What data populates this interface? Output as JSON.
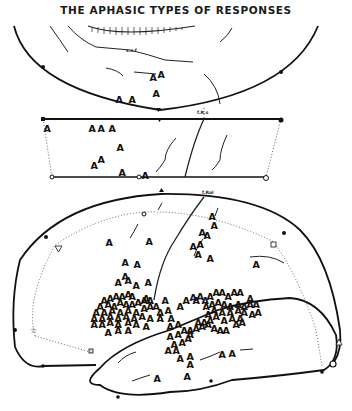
{
  "title": "THE APHASIC TYPES OF RESPONSES",
  "labels": {
    "top_small": "s.c.f",
    "mid_small": "f.R.s",
    "rolandic": "f.Rol"
  },
  "marker_symbol": "A",
  "panels": [
    {
      "name": "superior-view",
      "markers": [
        [
          153,
          77
        ],
        [
          161,
          74
        ],
        [
          119,
          99
        ],
        [
          132,
          99
        ],
        [
          156,
          93
        ]
      ]
    },
    {
      "name": "strip-view",
      "markers": [
        [
          47,
          128
        ],
        [
          92,
          128
        ],
        [
          101,
          128
        ],
        [
          112,
          128
        ],
        [
          120,
          147
        ],
        [
          94,
          165
        ],
        [
          101,
          159
        ],
        [
          122,
          172
        ],
        [
          145,
          175
        ]
      ]
    },
    {
      "name": "lateral-view",
      "markers": [
        [
          109,
          242
        ],
        [
          149,
          241
        ],
        [
          125,
          262
        ],
        [
          212,
          216
        ],
        [
          214,
          225
        ],
        [
          202,
          232
        ],
        [
          207,
          235
        ],
        [
          193,
          246
        ],
        [
          200,
          244
        ],
        [
          198,
          254
        ],
        [
          210,
          258
        ],
        [
          256,
          264
        ],
        [
          137,
          264
        ],
        [
          136,
          285
        ],
        [
          148,
          282
        ],
        [
          118,
          282
        ],
        [
          125,
          276
        ],
        [
          128,
          280
        ],
        [
          104,
          300
        ],
        [
          110,
          298
        ],
        [
          116,
          296
        ],
        [
          122,
          296
        ],
        [
          128,
          294
        ],
        [
          132,
          296
        ],
        [
          100,
          306
        ],
        [
          108,
          304
        ],
        [
          114,
          306
        ],
        [
          120,
          302
        ],
        [
          126,
          304
        ],
        [
          132,
          304
        ],
        [
          138,
          302
        ],
        [
          144,
          300
        ],
        [
          150,
          300
        ],
        [
          96,
          312
        ],
        [
          104,
          312
        ],
        [
          112,
          310
        ],
        [
          120,
          312
        ],
        [
          128,
          310
        ],
        [
          136,
          312
        ],
        [
          144,
          308
        ],
        [
          150,
          306
        ],
        [
          156,
          306
        ],
        [
          160,
          312
        ],
        [
          94,
          318
        ],
        [
          102,
          318
        ],
        [
          110,
          316
        ],
        [
          118,
          318
        ],
        [
          126,
          316
        ],
        [
          134,
          318
        ],
        [
          142,
          316
        ],
        [
          150,
          318
        ],
        [
          160,
          318
        ],
        [
          94,
          324
        ],
        [
          102,
          324
        ],
        [
          110,
          322
        ],
        [
          118,
          324
        ],
        [
          128,
          322
        ],
        [
          136,
          324
        ],
        [
          146,
          326
        ],
        [
          108,
          332
        ],
        [
          118,
          330
        ],
        [
          128,
          330
        ],
        [
          146,
          298
        ],
        [
          165,
          300
        ],
        [
          168,
          310
        ],
        [
          180,
          306
        ],
        [
          186,
          300
        ],
        [
          193,
          297
        ],
        [
          171,
          318
        ],
        [
          170,
          326
        ],
        [
          178,
          324
        ],
        [
          170,
          336
        ],
        [
          178,
          334
        ],
        [
          174,
          344
        ],
        [
          182,
          342
        ],
        [
          188,
          338
        ],
        [
          190,
          330
        ],
        [
          196,
          300
        ],
        [
          200,
          296
        ],
        [
          205,
          300
        ],
        [
          210,
          296
        ],
        [
          216,
          292
        ],
        [
          222,
          292
        ],
        [
          228,
          296
        ],
        [
          234,
          292
        ],
        [
          240,
          292
        ],
        [
          250,
          298
        ],
        [
          206,
          306
        ],
        [
          212,
          304
        ],
        [
          218,
          302
        ],
        [
          224,
          304
        ],
        [
          230,
          306
        ],
        [
          238,
          304
        ],
        [
          244,
          306
        ],
        [
          250,
          304
        ],
        [
          256,
          304
        ],
        [
          208,
          314
        ],
        [
          214,
          310
        ],
        [
          222,
          312
        ],
        [
          230,
          312
        ],
        [
          238,
          310
        ],
        [
          244,
          312
        ],
        [
          252,
          314
        ],
        [
          258,
          312
        ],
        [
          198,
          322
        ],
        [
          204,
          322
        ],
        [
          210,
          320
        ],
        [
          216,
          316
        ],
        [
          224,
          320
        ],
        [
          232,
          318
        ],
        [
          240,
          318
        ],
        [
          184,
          330
        ],
        [
          190,
          334
        ],
        [
          196,
          328
        ],
        [
          202,
          326
        ],
        [
          208,
          324
        ],
        [
          214,
          328
        ],
        [
          220,
          330
        ],
        [
          226,
          330
        ],
        [
          236,
          324
        ],
        [
          242,
          322
        ],
        [
          168,
          350
        ],
        [
          176,
          350
        ],
        [
          180,
          358
        ],
        [
          190,
          356
        ],
        [
          190,
          364
        ],
        [
          232,
          353
        ],
        [
          222,
          354
        ],
        [
          187,
          376
        ],
        [
          157,
          378
        ]
      ]
    }
  ]
}
